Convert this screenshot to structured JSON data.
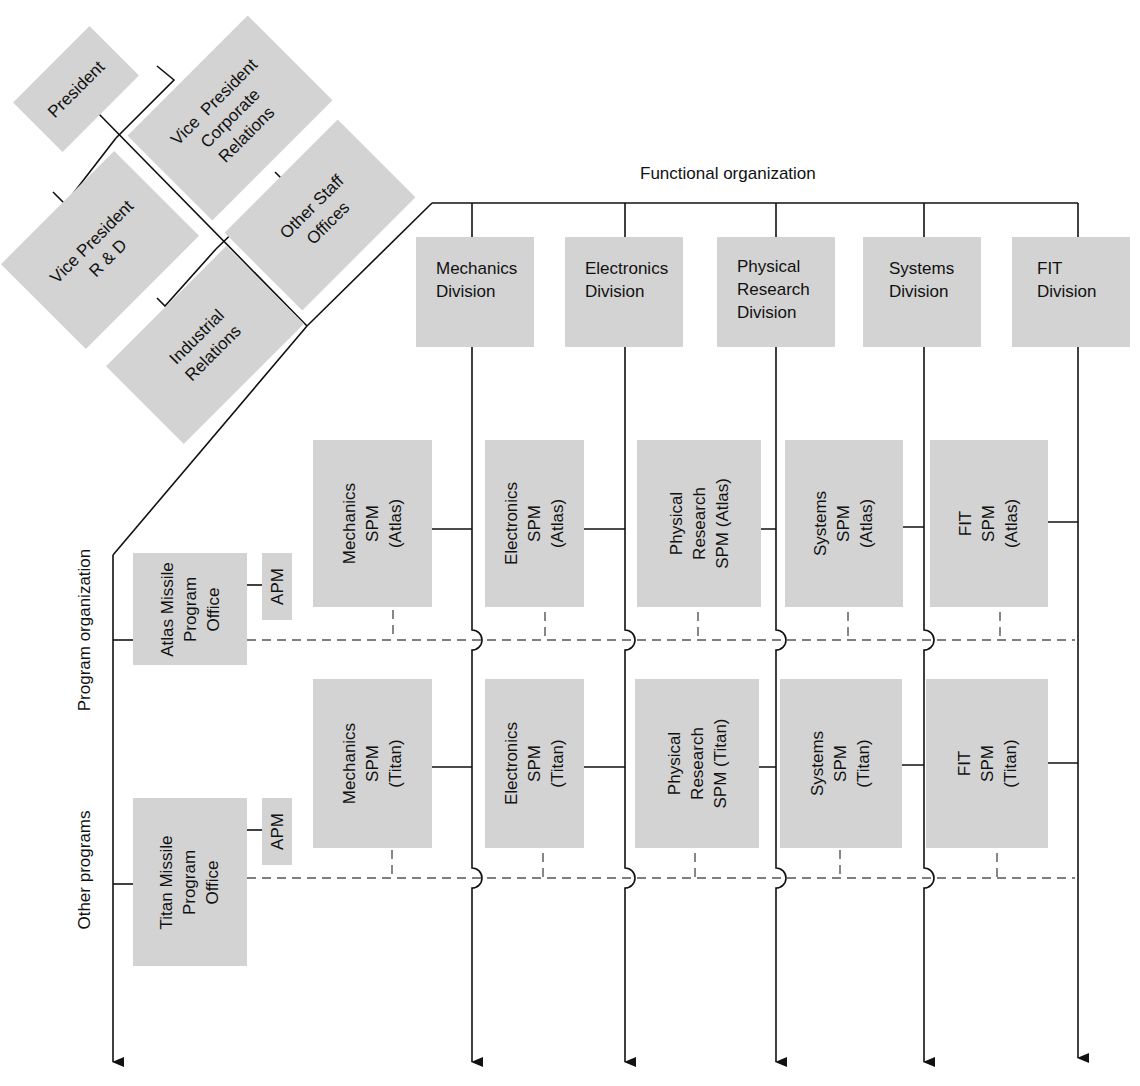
{
  "diagram": {
    "type": "matrix-organization-chart",
    "headings": {
      "functional": "Functional organization",
      "program": "Program organization",
      "other": "Other programs"
    },
    "executive": [
      {
        "id": "president",
        "label": "President"
      },
      {
        "id": "vp-corporate-relations",
        "label": "Vice  President\nCorporate\nRelations"
      },
      {
        "id": "vp-rd",
        "label": "Vice President\nR & D"
      },
      {
        "id": "other-staff-offices",
        "label": "Other Staff\nOffices"
      },
      {
        "id": "industrial-relations",
        "label": "Industrial\nRelations"
      }
    ],
    "divisions": [
      {
        "id": "mechanics",
        "label": "Mechanics\nDivision"
      },
      {
        "id": "electronics",
        "label": "Electronics\nDivision"
      },
      {
        "id": "physical-research",
        "label": "Physical\nResearch\nDivision"
      },
      {
        "id": "systems",
        "label": "Systems\nDivision"
      },
      {
        "id": "fit",
        "label": "FIT\nDivision"
      }
    ],
    "programs": [
      {
        "id": "atlas",
        "office": "Atlas Missile\nProgram\nOffice",
        "apm": "APM",
        "spms": [
          "Mechanics\nSPM\n(Atlas)",
          "Electronics\nSPM\n(Atlas)",
          "Physical\nResearch\nSPM (Atlas)",
          "Systems\nSPM\n(Atlas)",
          "FIT\nSPM\n(Atlas)"
        ]
      },
      {
        "id": "titan",
        "office": "Titan Missile\nProgram\nOffice",
        "apm": "APM",
        "spms": [
          "Mechanics\nSPM\n(Titan)",
          "Electronics\nSPM\n(Titan)",
          "Physical\nResearch\nSPM (Titan)",
          "Systems\nSPM\n(Titan)",
          "FIT\nSPM\n(Titan)"
        ]
      }
    ],
    "colors": {
      "box_fill": "#d3d3d3",
      "line": "#111111",
      "dashed": "#555555"
    }
  }
}
